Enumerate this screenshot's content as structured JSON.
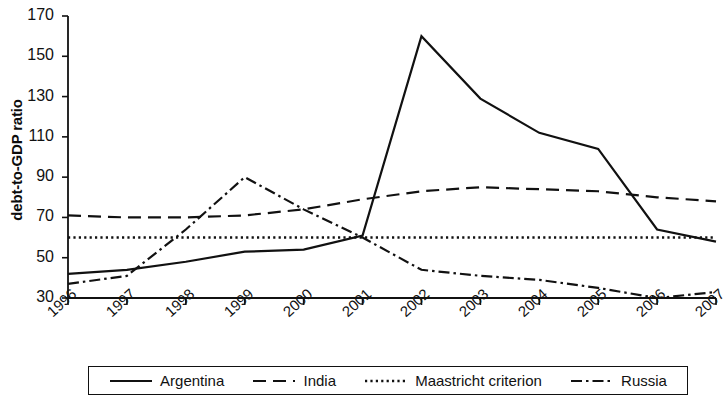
{
  "chart_data": {
    "type": "line",
    "title": "",
    "xlabel": "",
    "ylabel": "debt-to-GDP ratio",
    "categories": [
      "1996",
      "1997",
      "1998",
      "1999",
      "2000",
      "2001",
      "2002",
      "2003",
      "2004",
      "2005",
      "2006",
      "2007"
    ],
    "x_tick_labels": [
      "1996",
      "1997",
      "1998",
      "1999",
      "2000",
      "2001",
      "2002",
      "2003",
      "2004",
      "2005",
      "2006",
      "2007"
    ],
    "y_tick_labels": [
      "30",
      "50",
      "70",
      "90",
      "110",
      "130",
      "150",
      "170"
    ],
    "y_ticks": [
      30,
      50,
      70,
      90,
      110,
      130,
      150,
      170
    ],
    "ylim": [
      30,
      170
    ],
    "xlim": [
      "1996",
      "2007"
    ],
    "grid": false,
    "legend_position": "bottom",
    "series": [
      {
        "name": "Argentina",
        "style": "solid",
        "color": "#111111",
        "values": [
          42,
          44,
          48,
          53,
          54,
          61,
          160,
          129,
          112,
          104,
          64,
          58
        ]
      },
      {
        "name": "India",
        "style": "dashed",
        "color": "#111111",
        "values": [
          71,
          70,
          70,
          71,
          74,
          79,
          83,
          85,
          84,
          83,
          80,
          78
        ]
      },
      {
        "name": "Maastricht criterion",
        "style": "dotted",
        "color": "#111111",
        "values": [
          60,
          60,
          60,
          60,
          60,
          60,
          60,
          60,
          60,
          60,
          60,
          60
        ]
      },
      {
        "name": "Russia",
        "style": "dashdot",
        "color": "#111111",
        "values": [
          37,
          41,
          64,
          90,
          74,
          60,
          44,
          41,
          39,
          35,
          30,
          33
        ]
      }
    ]
  },
  "legend": {
    "items": [
      {
        "label": "Argentina",
        "style": "solid"
      },
      {
        "label": "India",
        "style": "dashed"
      },
      {
        "label": "Maastricht criterion",
        "style": "dotted"
      },
      {
        "label": "Russia",
        "style": "dashdot"
      }
    ]
  },
  "axes": {
    "y_title": "debt-to-GDP ratio"
  }
}
